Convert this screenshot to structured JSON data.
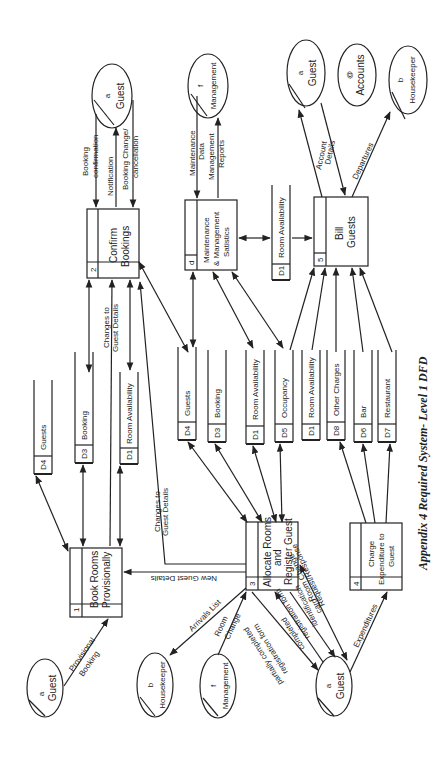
{
  "caption": "Appendix 4  Required System- Level 1 DFD",
  "processes": {
    "p1": {
      "id": "1",
      "label1": "Book Rooms",
      "label2": "Provisionally"
    },
    "p2": {
      "id": "2",
      "label1": "Confirm",
      "label2": "Bookings"
    },
    "p3": {
      "id": "3",
      "label1": "Allocate Rooms",
      "label2": "and",
      "label3": "Register Guest"
    },
    "p4": {
      "id": "4",
      "label1": "Charge",
      "label2": "Expenditure to",
      "label3": "Guest"
    },
    "p5": {
      "id": "5",
      "label1": "Bill",
      "label2": "Guests"
    },
    "pd": {
      "id": "d",
      "label1": "Maintenance",
      "label2": "& Management",
      "label3": "Satistics"
    }
  },
  "entities": {
    "guest_p1": {
      "id": "a",
      "label": "Guest"
    },
    "housekeeper_p3": {
      "id": "b",
      "label": "Housekeeper"
    },
    "management_p3": {
      "id": "f",
      "label": "Management"
    },
    "guest_p3": {
      "id": "a",
      "label": "Guest"
    },
    "guest_p2": {
      "id": "a",
      "label": "Guest"
    },
    "management_pd": {
      "id": "f",
      "label": "Management"
    },
    "guest_p5": {
      "id": "a",
      "label": "Guest"
    },
    "accounts": {
      "id": "@",
      "label": "Accounts"
    },
    "housekeeper_p5": {
      "id": "b",
      "label": "Housekeeper"
    }
  },
  "stores": {
    "left": [
      {
        "id": "D4",
        "label": "Guests"
      },
      {
        "id": "D3",
        "label": "Booking"
      },
      {
        "id": "D1",
        "label": "Room Availability"
      }
    ],
    "middle": [
      {
        "id": "D4",
        "label": "Guests"
      },
      {
        "id": "D3",
        "label": "Booking"
      },
      {
        "id": "D1",
        "label": "Room Availability"
      },
      {
        "id": "D5",
        "label": "Occupancy"
      },
      {
        "id": "D1",
        "label": "Room Availability"
      },
      {
        "id": "D8",
        "label": "Other Charges"
      },
      {
        "id": "D6",
        "label": "Bar"
      },
      {
        "id": "D7",
        "label": "Restaurant"
      }
    ],
    "top": {
      "id": "D1",
      "label": "Room Availability"
    }
  },
  "flows": {
    "provisional_booking": [
      "Provisional",
      "Booking"
    ],
    "arrivals_list": "Arrivals List",
    "room_change": [
      "Room",
      "Change"
    ],
    "partially_completed": [
      "partially completed",
      "registration form"
    ],
    "completed_reg": [
      "completed",
      "registration form"
    ],
    "identification_card": [
      "identification",
      "card"
    ],
    "room_change_req": [
      "Room Change",
      "Request/Response"
    ],
    "expenditures": "Expenditures",
    "new_guest_details": "New Guest Details",
    "changes_to_guest_left": [
      "Changes to",
      "Guest Details"
    ],
    "changes_to_guest_right": [
      "Changes to",
      "Guest Details"
    ],
    "booking_confirmation": [
      "Booking",
      "confirmation"
    ],
    "notification": "Notification",
    "booking_change": [
      "Booking Change/",
      "cancellation"
    ],
    "maintenance_data": [
      "Maintenance",
      "Data"
    ],
    "management_reports": [
      "Management",
      "Reports"
    ],
    "account_details": [
      "Account",
      "Details"
    ],
    "departures": "Departures"
  }
}
